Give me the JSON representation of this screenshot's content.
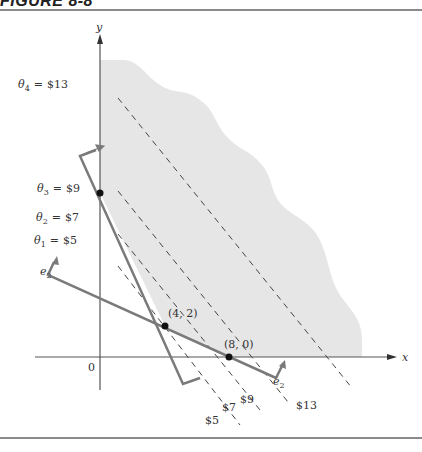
{
  "figure": {
    "header": "FIGURE 8-8"
  },
  "axes": {
    "x_label": "x",
    "y_label": "y",
    "origin_label": "0"
  },
  "constraints": [
    {
      "name": "e1",
      "label": "e",
      "subscript": "1",
      "description": "steep constraint line through (0,10), (4,2)"
    },
    {
      "name": "e2",
      "label": "e",
      "subscript": "2",
      "description": "shallow constraint line through (4,2), (8,0)"
    }
  ],
  "e2_labels": {
    "left": {
      "base": "e",
      "sub": "2"
    },
    "right": {
      "base": "e",
      "sub": "2"
    }
  },
  "points": [
    {
      "label": "(4, 2)",
      "x": 4,
      "y": 2
    },
    {
      "label": "(8, 0)",
      "x": 8,
      "y": 0
    },
    {
      "label": "",
      "x": 0,
      "y": 10
    }
  ],
  "isoprofit": {
    "left_labels": [
      {
        "theta": "θ",
        "sub": "4",
        "eq": "=",
        "value": "$13"
      },
      {
        "theta": "θ",
        "sub": "3",
        "eq": "=",
        "value": "$9"
      },
      {
        "theta": "θ",
        "sub": "2",
        "eq": "=",
        "value": "$7"
      },
      {
        "theta": "θ",
        "sub": "1",
        "eq": "=",
        "value": "$5"
      }
    ],
    "bottom_labels": [
      "$5",
      "$7",
      "$9",
      "$13"
    ]
  },
  "colors": {
    "feasible_region": "#e6e6e6",
    "constraint_line": "#7a7a7a",
    "axis": "#555555",
    "dashed": "#444444",
    "point": "#111111"
  }
}
